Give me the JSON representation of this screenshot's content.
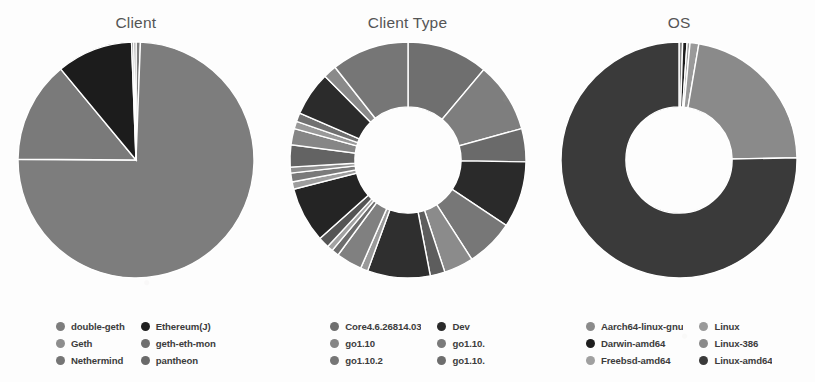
{
  "page": {
    "background_color": "#fdfdfd",
    "text_color": "#4a4a4a"
  },
  "panels": [
    {
      "title": "Client",
      "legend_columns": [
        [
          "double-geth",
          "Geth",
          "Nethermind"
        ],
        [
          "Ethereum(J)",
          "geth-eth-mon",
          "pantheon"
        ]
      ]
    },
    {
      "title": "Client Type",
      "legend_columns": [
        [
          "Core4.6.26814.03",
          "go1.10",
          "go1.10.2"
        ],
        [
          "Dev",
          "go1.10.",
          "go1.10."
        ]
      ]
    },
    {
      "title": "OS",
      "legend_columns": [
        [
          "Aarch64-linux-gnu",
          "Darwin-amd64",
          "Freebsd-amd64"
        ],
        [
          "Linux",
          "Linux-386",
          "Linux-amd64"
        ]
      ]
    }
  ],
  "chart_data": [
    {
      "type": "pie",
      "title": "Client",
      "xlabel": "",
      "ylabel": "",
      "legend_position": "bottom",
      "grid": false,
      "hole": 0.0,
      "categories": [
        "double-geth",
        "Geth",
        "Nethermind",
        "Ethereum(J)",
        "geth-eth-mon",
        "pantheon"
      ],
      "values": [
        0.6,
        74.5,
        13.9,
        10.4,
        0.3,
        0.3
      ],
      "colors": [
        "#7d7d7d",
        "#7d7d7d",
        "#7a7a7a",
        "#1c1c1c",
        "#8a8a8a",
        "#868686"
      ]
    },
    {
      "type": "pie",
      "title": "Client Type",
      "xlabel": "",
      "ylabel": "",
      "legend_position": "bottom",
      "grid": false,
      "hole": 0.45,
      "categories": [
        "Core4.6.26814.03",
        "go1.10",
        "go1.10.2",
        "Dev",
        "go1.10.",
        "go1.10.",
        "seg-7",
        "seg-8",
        "seg-9",
        "seg-10",
        "seg-11",
        "seg-12",
        "seg-13",
        "seg-14",
        "seg-15",
        "seg-16",
        "seg-17",
        "seg-18",
        "seg-19",
        "seg-20",
        "seg-21",
        "seg-22",
        "seg-23",
        "seg-24"
      ],
      "values": [
        11.0,
        9.5,
        4.5,
        9.0,
        6.5,
        4.0,
        2.0,
        8.5,
        1.0,
        3.5,
        1.0,
        0.8,
        1.5,
        7.5,
        1.0,
        1.2,
        0.8,
        3.0,
        2.2,
        1.0,
        1.2,
        6.0,
        1.8,
        10.5
      ],
      "colors": [
        "#6f6f6f",
        "#7e7e7e",
        "#6a6a6a",
        "#2a2a2a",
        "#777777",
        "#8b8b8b",
        "#5d5d5d",
        "#2f2f2f",
        "#9a9a9a",
        "#808080",
        "#6d6d6d",
        "#a2a2a2",
        "#555555",
        "#242424",
        "#9d9d9d",
        "#7a7a7a",
        "#8e8e8e",
        "#636363",
        "#868686",
        "#999999",
        "#707070",
        "#2b2b2b",
        "#8a8a8a",
        "#767676"
      ]
    },
    {
      "type": "pie",
      "title": "OS",
      "xlabel": "",
      "ylabel": "",
      "legend_position": "bottom",
      "grid": false,
      "hole": 0.45,
      "categories": [
        "Aarch64-linux-gnu",
        "Darwin-amd64",
        "Freebsd-amd64",
        "Linux",
        "Linux-386",
        "Linux-amd64"
      ],
      "values": [
        0.5,
        0.6,
        0.4,
        1.2,
        22.0,
        75.3
      ],
      "colors": [
        "#8b8b8b",
        "#1e1e1e",
        "#a0a0a0",
        "#9a9a9a",
        "#8a8a8a",
        "#3a3a3a"
      ]
    }
  ],
  "legend_swatch_colors": {
    "client": [
      "#7d7d7d",
      "#8d8d8d",
      "#757575",
      "#1f1f1f",
      "#6f6f6f",
      "#6a6a6a"
    ],
    "client_type": [
      "#6f6f6f",
      "#858585",
      "#767676",
      "#2a2a2a",
      "#7a7a7a",
      "#6d6d6d"
    ],
    "os": [
      "#8b8b8b",
      "#1e1e1e",
      "#a0a0a0",
      "#9a9a9a",
      "#8a8a8a",
      "#3a3a3a"
    ]
  }
}
